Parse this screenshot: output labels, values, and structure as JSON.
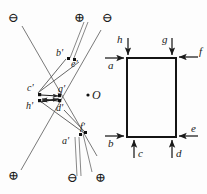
{
  "figure": {
    "type": "geometric-optics-force-diagram",
    "background_color": "#fdfdfd",
    "stroke_color": "#3a3a3a",
    "rect_stroke_color": "#1a1a1a",
    "text_color": "#1a1a1a",
    "center_point_label": "O"
  },
  "left_diagram": {
    "name": "image-plane-construction",
    "charge_symbols": [
      {
        "id": "top-left",
        "glyph": "⊖",
        "polarity": "minus",
        "x": 13,
        "y": 18
      },
      {
        "id": "top-mid",
        "glyph": "⊕",
        "polarity": "plus",
        "x": 79,
        "y": 18
      },
      {
        "id": "top-right",
        "glyph": "⊖",
        "polarity": "minus",
        "x": 107,
        "y": 18
      },
      {
        "id": "bottom-left",
        "glyph": "⊕",
        "polarity": "plus",
        "x": 13,
        "y": 176
      },
      {
        "id": "bottom-mid",
        "glyph": "⊖",
        "polarity": "minus",
        "x": 72,
        "y": 178
      },
      {
        "id": "bottom-right",
        "glyph": "⊕",
        "polarity": "plus",
        "x": 100,
        "y": 178
      }
    ],
    "points": [
      {
        "label": "b'",
        "x": 62,
        "y": 54
      },
      {
        "label": "e'",
        "x": 76,
        "y": 63
      },
      {
        "label": "c'",
        "x": 33,
        "y": 88
      },
      {
        "label": "g'",
        "x": 63,
        "y": 89
      },
      {
        "label": "h'",
        "x": 32,
        "y": 104
      },
      {
        "label": "d'",
        "x": 61,
        "y": 107
      },
      {
        "label": "f'",
        "x": 84,
        "y": 128
      },
      {
        "label": "a'",
        "x": 66,
        "y": 140
      }
    ],
    "center_marker": {
      "label": "O",
      "x": 90,
      "y": 96
    }
  },
  "right_diagram": {
    "name": "force-rectangle",
    "rect": {
      "x": 127,
      "y": 58,
      "width": 49,
      "height": 79
    },
    "force_arrows": [
      {
        "label": "h",
        "direction": "down",
        "position": "top-left",
        "label_x": 112,
        "label_y": 40
      },
      {
        "label": "g",
        "direction": "down",
        "position": "top-right",
        "label_x": 157,
        "label_y": 40
      },
      {
        "label": "f",
        "direction": "left",
        "position": "right-top",
        "label_x": 194,
        "label_y": 52
      },
      {
        "label": "a",
        "direction": "right",
        "position": "left-top",
        "label_x": 108,
        "label_y": 59
      },
      {
        "label": "b",
        "direction": "right",
        "position": "left-bottom",
        "label_x": 108,
        "label_y": 143
      },
      {
        "label": "e",
        "direction": "left",
        "position": "right-bottom",
        "label_x": 193,
        "label_y": 130
      },
      {
        "label": "c",
        "direction": "up",
        "position": "bottom-left",
        "label_x": 140,
        "label_y": 152
      },
      {
        "label": "d",
        "direction": "up",
        "position": "bottom-right",
        "label_x": 186,
        "label_y": 152
      }
    ]
  }
}
